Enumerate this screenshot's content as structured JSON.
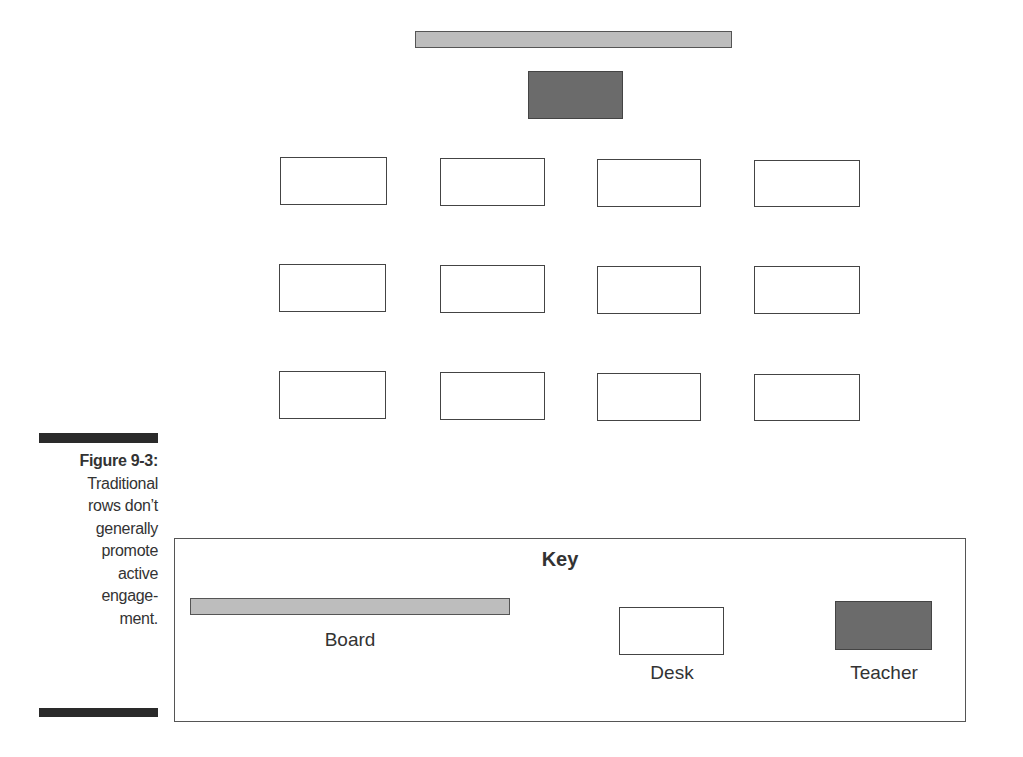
{
  "diagram": {
    "type": "classroom-layout",
    "board": {
      "label": "Board",
      "color": "#bdbdbd"
    },
    "teacher": {
      "label": "Teacher",
      "color": "#6b6b6b"
    },
    "desk_grid": {
      "rows": 3,
      "columns": 4,
      "desk_color": "#ffffff"
    }
  },
  "caption": {
    "figure_label": "Figure 9-3:",
    "lines": [
      "Traditional",
      "rows don’t",
      "generally",
      "promote",
      "active",
      "engage-",
      "ment."
    ]
  },
  "key": {
    "title": "Key",
    "items": [
      {
        "label": "Board"
      },
      {
        "label": "Desk"
      },
      {
        "label": "Teacher"
      }
    ]
  }
}
